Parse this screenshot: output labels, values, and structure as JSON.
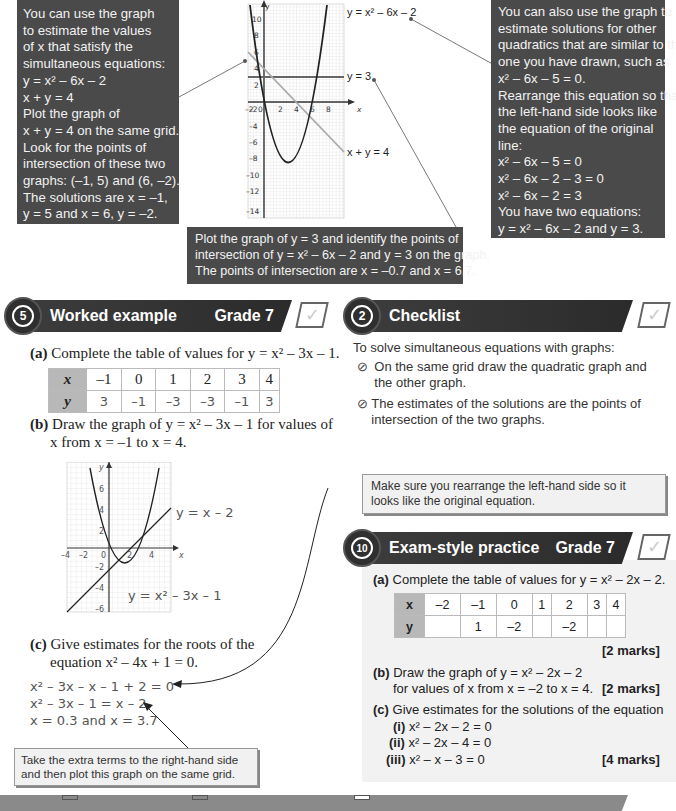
{
  "top": {
    "left_note": {
      "lines": [
        "You can use the graph",
        "to estimate the values",
        "of x that satisfy the",
        "simultaneous equations:",
        "y = x² – 6x – 2",
        "x + y = 4",
        "Plot the graph of",
        "x + y = 4 on the same grid.",
        "Look for the points of",
        "intersection of these two",
        "graphs: (–1, 5) and (6, –2).",
        "The solutions are x = –1,",
        "y = 5 and x = 6, y = –2."
      ]
    },
    "right_note": {
      "lines": [
        "You can also use the graph to",
        "estimate solutions for other",
        "quadratics that are similar to the",
        "one you have drawn, such as",
        "x² – 6x – 5 = 0.",
        "Rearrange this equation so that",
        "the left-hand side looks like",
        "the equation of the original",
        "line:",
        "x² – 6x – 5 = 0",
        "x² – 6x – 2 – 3 = 0",
        "x² – 6x – 2 = 3",
        "You have two equations:",
        "y = x² – 6x – 2 and y = 3."
      ]
    },
    "bottom_note": {
      "lines": [
        "Plot the graph of y = 3 and identify the points of",
        "intersection of y = x² – 6x – 2 and y = 3 on the graph.",
        "The points of intersection are x = –0.7 and x = 6.7."
      ]
    },
    "graph_labels": {
      "curve": "y = x² – 6x – 2",
      "hline": "y = 3",
      "line": "x + y = 4",
      "x_axis": "x",
      "y_axis": "y",
      "y_ticks": [
        "10",
        "8",
        "6",
        "4",
        "2",
        "–2",
        "–4",
        "–6",
        "–8",
        "–10",
        "–12",
        "–14"
      ],
      "x_ticks": [
        "–2",
        "0",
        "2",
        "4",
        "6",
        "8"
      ]
    }
  },
  "worked_example": {
    "badge": "5",
    "title": "Worked example",
    "grade": "Grade 7",
    "tick": "✓",
    "part_a_label": "(a)",
    "part_a_text": "Complete the table of values for y = x² – 3x – 1.",
    "table": {
      "x_label": "x",
      "y_label": "y",
      "x": [
        "–1",
        "0",
        "1",
        "2",
        "3",
        "4"
      ],
      "y": [
        "3",
        "–1",
        "–3",
        "–3",
        "–1",
        "3"
      ]
    },
    "part_b_label": "(b)",
    "part_b_lines": [
      "Draw the graph of y = x² – 3x – 1 for values of",
      "x from x = –1 to x = 4."
    ],
    "graph": {
      "line_label": "y = x – 2",
      "curve_label": "y = x² – 3x – 1",
      "x_axis": "x",
      "y_axis": "y",
      "x_ticks": [
        "–4",
        "–2",
        "0",
        "2",
        "4"
      ],
      "y_ticks": [
        "6",
        "4",
        "2",
        "–2",
        "–4",
        "–6"
      ]
    },
    "part_c_label": "(c)",
    "part_c_lines": [
      "Give estimates for the roots of the",
      "equation x² – 4x + 1 = 0."
    ],
    "working": [
      "x² – 3x – x – 1 + 2 = 0",
      "x² – 3x – 1 = x – 2",
      "x = 0.3 and x = 3.7"
    ],
    "hint": "Take the extra terms to the right-hand side and then plot this graph on the same grid."
  },
  "checklist": {
    "badge": "2",
    "title": "Checklist",
    "tick": "✓",
    "intro": "To solve simultaneous equations with graphs:",
    "items": [
      "On the same grid draw the quadratic graph and the other graph.",
      "The estimates of the solutions are the points of intersection of the two graphs."
    ]
  },
  "tip": "Make sure you rearrange the left-hand side so it looks like the original equation.",
  "exam_practice": {
    "badge": "10",
    "title": "Exam-style practice",
    "grade": "Grade 7",
    "tick": "✓",
    "part_a_label": "(a)",
    "part_a_text": "Complete the table of values for y = x² – 2x – 2.",
    "table": {
      "x_label": "x",
      "y_label": "y",
      "x": [
        "–2",
        "–1",
        "0",
        "1",
        "2",
        "3",
        "4"
      ],
      "y": [
        "",
        "1",
        "–2",
        "",
        "–2",
        "",
        ""
      ]
    },
    "part_a_marks": "[2 marks]",
    "part_b_label": "(b)",
    "part_b_lines": [
      "Draw the graph of y = x² – 2x – 2",
      "for values of x from x = –2 to x = 4."
    ],
    "part_b_marks": "[2 marks]",
    "part_c_label": "(c)",
    "part_c_text": "Give estimates for the solutions of the equation",
    "sub": [
      {
        "label": "(i)",
        "eq": "x² – 2x – 2 = 0"
      },
      {
        "label": "(ii)",
        "eq": "x² – 2x – 4 = 0"
      },
      {
        "label": "(iii)",
        "eq": "x² – x – 3 = 0"
      }
    ],
    "part_c_marks": "[4 marks]"
  }
}
